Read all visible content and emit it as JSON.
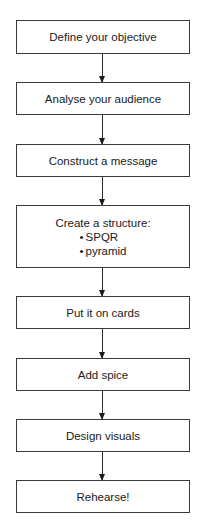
{
  "diagram": {
    "type": "flowchart",
    "direction": "top-to-bottom",
    "steps": [
      {
        "label": "Define your objective"
      },
      {
        "label": "Analyse your audience"
      },
      {
        "label": "Construct a message"
      },
      {
        "label": "Create a structure:",
        "bullets": [
          "SPQR",
          "pyramid"
        ]
      },
      {
        "label": "Put it on cards"
      },
      {
        "label": "Add spice"
      },
      {
        "label": "Design visuals"
      },
      {
        "label": "Rehearse!"
      }
    ],
    "colors": {
      "border": "#3a3a3a",
      "text": "#1a1a1a",
      "background": "#ffffff"
    }
  }
}
